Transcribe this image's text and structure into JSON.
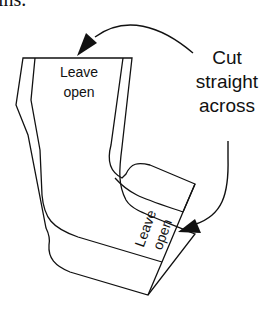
{
  "figure": {
    "partial_caption": "ins.",
    "callout": {
      "line1": "Cut",
      "line2": "straight",
      "line3": "across"
    },
    "top_opening_label": {
      "line1": "Leave",
      "line2": "open"
    },
    "toe_opening_label": {
      "line1": "Leave",
      "line2": "open"
    },
    "colors": {
      "stroke": "#111111",
      "background": "#ffffff"
    }
  }
}
